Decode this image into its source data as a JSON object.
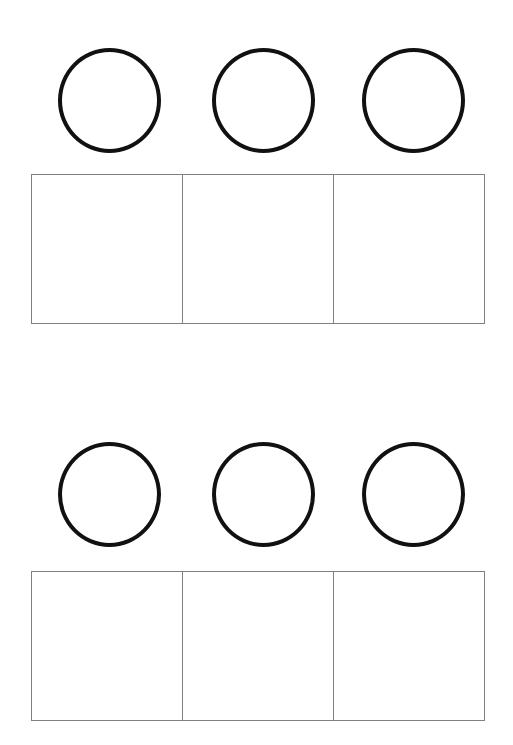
{
  "page": {
    "width": 513,
    "height": 745,
    "background_color": "#ffffff"
  },
  "style": {
    "circle_stroke_color": "#111111",
    "circle_stroke_width": 4,
    "circle_diameter": 103,
    "table_border_color": "#808080",
    "table_border_width": 1.5
  },
  "groups": [
    {
      "name": "group-1",
      "circles": [
        {
          "name": "circle-1",
          "shape": "circle-outline",
          "filled": false,
          "content": ""
        },
        {
          "name": "circle-2",
          "shape": "circle-outline",
          "filled": false,
          "content": ""
        },
        {
          "name": "circle-3",
          "shape": "circle-outline",
          "filled": false,
          "content": ""
        }
      ],
      "cells": [
        {
          "name": "cell-1",
          "content": ""
        },
        {
          "name": "cell-2",
          "content": ""
        },
        {
          "name": "cell-3",
          "content": ""
        }
      ]
    },
    {
      "name": "group-2",
      "circles": [
        {
          "name": "circle-1",
          "shape": "circle-outline",
          "filled": false,
          "content": ""
        },
        {
          "name": "circle-2",
          "shape": "circle-outline",
          "filled": false,
          "content": ""
        },
        {
          "name": "circle-3",
          "shape": "circle-outline",
          "filled": false,
          "content": ""
        }
      ],
      "cells": [
        {
          "name": "cell-1",
          "content": ""
        },
        {
          "name": "cell-2",
          "content": ""
        },
        {
          "name": "cell-3",
          "content": ""
        }
      ]
    }
  ]
}
